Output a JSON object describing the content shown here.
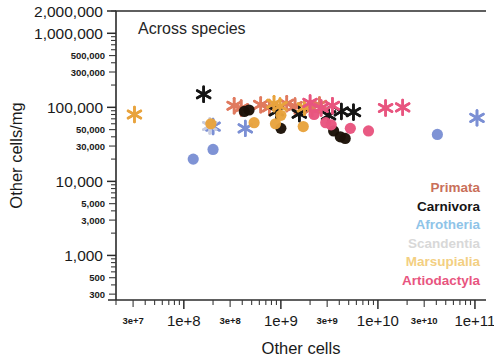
{
  "panel": {
    "title": "Across species"
  },
  "axes": {
    "xlabel": "Other cells",
    "ylabel": "Other cells/mg"
  },
  "legend": {
    "entries": [
      {
        "label": "Primata",
        "color": "#c9705a"
      },
      {
        "label": "Carnivora",
        "color": "#151515"
      },
      {
        "label": "Afrotheria",
        "color": "#8fc4e8"
      },
      {
        "label": "Scandentia",
        "color": "#d8d8d8"
      },
      {
        "label": "Marsupialia",
        "color": "#f3cf82"
      },
      {
        "label": "Artiodactyla",
        "color": "#e8557f"
      }
    ]
  },
  "chart_data": {
    "type": "scatter",
    "title": "Across species",
    "xlabel": "Other cells",
    "ylabel": "Other cells/mg",
    "xscale": "log",
    "yscale": "log",
    "xlim": [
      20000000,
      130000000000
    ],
    "ylim": [
      250,
      2000000
    ],
    "grid": false,
    "legend_position": "right-inside-lower",
    "x_ticks_major": [
      "1e+8",
      "1e+9",
      "1e+10",
      "1e+11"
    ],
    "x_ticks_major_values": [
      100000000,
      1000000000,
      10000000000,
      100000000000
    ],
    "x_ticks_minor": [
      "3e+7",
      "3e+8",
      "3e+9",
      "3e+10"
    ],
    "x_ticks_minor_values": [
      30000000,
      300000000,
      3000000000,
      30000000000
    ],
    "y_ticks_major": [
      "2,000,000",
      "1,000,000",
      "100,000",
      "10,000",
      "1,000"
    ],
    "y_ticks_major_values": [
      2000000,
      1000000,
      100000,
      10000,
      1000
    ],
    "y_ticks_minor": [
      "500,000",
      "300,000",
      "50,000",
      "30,000",
      "5,000",
      "3,000",
      "500",
      "300"
    ],
    "y_ticks_minor_values": [
      500000,
      300000,
      50000,
      30000,
      5000,
      3000,
      500,
      300
    ],
    "series": [
      {
        "name": "Primata",
        "color": "#e07a5f",
        "marker": "star",
        "points": [
          {
            "x": 330000000,
            "y": 105000
          },
          {
            "x": 390000000,
            "y": 98000
          },
          {
            "x": 620000000,
            "y": 108000
          },
          {
            "x": 760000000,
            "y": 100000
          },
          {
            "x": 1150000000,
            "y": 112000
          },
          {
            "x": 1400000000,
            "y": 104000
          },
          {
            "x": 2100000000,
            "y": 96000
          },
          {
            "x": 2500000000,
            "y": 108000
          }
        ]
      },
      {
        "name": "Carnivora",
        "color": "#151515",
        "marker": "star",
        "points": [
          {
            "x": 160000000,
            "y": 150000
          },
          {
            "x": 900000000,
            "y": 88000
          },
          {
            "x": 1550000000,
            "y": 82000
          },
          {
            "x": 3100000000,
            "y": 78000
          },
          {
            "x": 4200000000,
            "y": 88000
          },
          {
            "x": 5600000000,
            "y": 86000
          }
        ]
      },
      {
        "name": "Carnivora-filled",
        "color": "#1c1208",
        "marker": "circle",
        "points": [
          {
            "x": 420000000,
            "y": 88000
          },
          {
            "x": 470000000,
            "y": 92000
          },
          {
            "x": 1000000000,
            "y": 52000
          },
          {
            "x": 3500000000,
            "y": 48000
          },
          {
            "x": 4100000000,
            "y": 40000
          },
          {
            "x": 4600000000,
            "y": 38000
          }
        ]
      },
      {
        "name": "Afrotheria",
        "color": "#7b8fd4",
        "marker": "circle",
        "points": [
          {
            "x": 125000000,
            "y": 20000
          },
          {
            "x": 200000000,
            "y": 27000
          },
          {
            "x": 41000000000,
            "y": 43000
          }
        ]
      },
      {
        "name": "Afrotheria-star",
        "color": "#7b8fd4",
        "marker": "star",
        "points": [
          {
            "x": 200000000,
            "y": 55000
          },
          {
            "x": 430000000,
            "y": 52000
          },
          {
            "x": 105000000000,
            "y": 72000
          }
        ]
      },
      {
        "name": "Scandentia",
        "color": "#c8cde0",
        "marker": "star",
        "points": [
          {
            "x": 185000000,
            "y": 56000
          }
        ]
      },
      {
        "name": "Marsupialia",
        "color": "#e8a33d",
        "marker": "star",
        "points": [
          {
            "x": 31000000,
            "y": 80000
          },
          {
            "x": 850000000,
            "y": 112000
          },
          {
            "x": 980000000,
            "y": 104000
          },
          {
            "x": 1750000000,
            "y": 100000
          }
        ]
      },
      {
        "name": "Marsupialia-filled",
        "color": "#e8a33d",
        "marker": "circle",
        "points": [
          {
            "x": 190000000,
            "y": 60000
          },
          {
            "x": 530000000,
            "y": 62000
          },
          {
            "x": 880000000,
            "y": 60000
          },
          {
            "x": 1000000000,
            "y": 78000
          },
          {
            "x": 1700000000,
            "y": 55000
          }
        ]
      },
      {
        "name": "Artiodactyla",
        "color": "#e8557f",
        "marker": "star",
        "points": [
          {
            "x": 2000000000,
            "y": 115000
          },
          {
            "x": 2600000000,
            "y": 98000
          },
          {
            "x": 3400000000,
            "y": 105000
          },
          {
            "x": 12000000000,
            "y": 98000
          },
          {
            "x": 18000000000,
            "y": 100000
          }
        ]
      },
      {
        "name": "Artiodactyla-filled",
        "color": "#e8557f",
        "marker": "circle",
        "points": [
          {
            "x": 2200000000,
            "y": 80000
          },
          {
            "x": 2900000000,
            "y": 62000
          },
          {
            "x": 3300000000,
            "y": 58000
          },
          {
            "x": 5200000000,
            "y": 52000
          },
          {
            "x": 8000000000,
            "y": 48000
          }
        ]
      }
    ]
  }
}
